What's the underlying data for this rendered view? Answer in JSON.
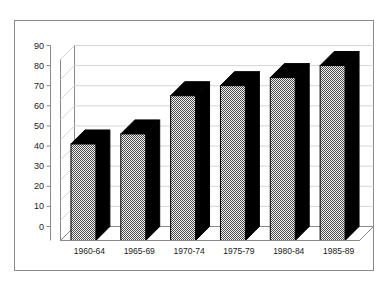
{
  "chart_data": {
    "type": "bar",
    "title": "",
    "subtitle": "",
    "xlabel": "",
    "ylabel": "",
    "categories": [
      "1960-64",
      "1965-69",
      "1970-74",
      "1975-79",
      "1980-84",
      "1985-89"
    ],
    "values": [
      48,
      53,
      72,
      77,
      81,
      87
    ],
    "ylim": [
      0,
      90
    ],
    "yticks": [
      0,
      10,
      20,
      30,
      40,
      50,
      60,
      70,
      80,
      90
    ],
    "ytick_labels": [
      "0",
      "10",
      "20",
      "30",
      "40",
      "50",
      "60",
      "70",
      "80",
      "90"
    ],
    "grid": true,
    "legend": null,
    "legend_position": "none",
    "style": {
      "three_d": true,
      "bar_front_fill": "#cccccc",
      "bar_front_pattern": "checkerboard-dither",
      "bar_side_fill": "#000000",
      "bar_top_fill": "#000000",
      "bar_outline": "#000000",
      "gridline_color": "#d6d6d6",
      "axis_color": "#8a8a8a",
      "frame_color": "#8a8a8a",
      "background": "#ffffff",
      "text_color": "#1a1a1a"
    }
  }
}
